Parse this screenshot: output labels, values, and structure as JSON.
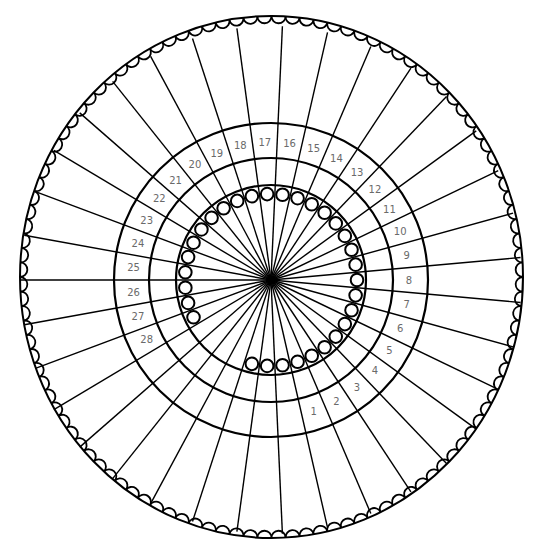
{
  "figure": {
    "colors": {
      "line": "#000000",
      "number_text": "#6a6a6a",
      "background": "#ffffff"
    },
    "center": {
      "x": 271,
      "y": 280
    },
    "outer_ring": {
      "cx": 271.5,
      "cy": 277,
      "rx": 251.5,
      "ry": 261,
      "scallop_count": 112,
      "scallop_radius": 7.5
    },
    "rings": [
      {
        "name": "middle-ring",
        "r": 157
      },
      {
        "name": "number-ring",
        "r": 122
      },
      {
        "name": "inner-ring",
        "r": 95
      }
    ],
    "spokes": {
      "count": 35,
      "start_angle_deg": 180,
      "length": 254
    },
    "numbers": {
      "labels": [
        "1",
        "2",
        "3",
        "4",
        "5",
        "6",
        "7",
        "8",
        "9",
        "10",
        "11",
        "12",
        "13",
        "14",
        "15",
        "16",
        "17",
        "18",
        "19",
        "20",
        "21",
        "22",
        "23",
        "24",
        "25",
        "26",
        "27",
        "28"
      ],
      "radius": 138,
      "cells_total": 35
    },
    "small_circles": {
      "radius": 6.3,
      "orbit_r": 86,
      "missing_cells": [
        29,
        30,
        31,
        32
      ]
    }
  }
}
